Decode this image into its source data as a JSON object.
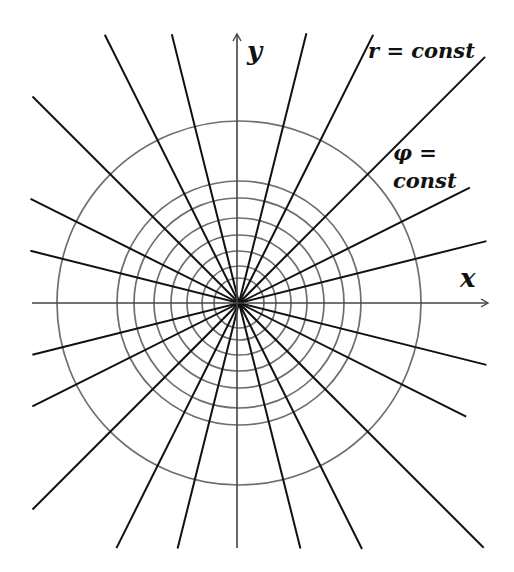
{
  "diagram": {
    "center": {
      "x": 239,
      "y": 303
    },
    "colors": {
      "rays": "#111111",
      "circles": "#6e6e6e",
      "axes": "#444444",
      "background": "#ffffff"
    },
    "axes": {
      "x_label": "x",
      "y_label": "y"
    },
    "annotations": {
      "r_const": "r = const",
      "phi_const_line1": "φ =",
      "phi_const_line2": "const"
    },
    "circle_radii": [
      25,
      37,
      52,
      68,
      85,
      105,
      122,
      182
    ],
    "ray_slopes_description": "Lines through origin with slopes 0, ±1/4, ±1/2, ±1, ±2, ±4, ∞",
    "rays": [
      {
        "angle_deg": 14.04,
        "length_pos": 255,
        "length_neg": 213
      },
      {
        "angle_deg": 26.57,
        "length_pos": 258,
        "length_neg": 231
      },
      {
        "angle_deg": 45.0,
        "length_pos": 348,
        "length_neg": 292
      },
      {
        "angle_deg": 63.43,
        "length_pos": 300,
        "length_neg": 274
      },
      {
        "angle_deg": 75.96,
        "length_pos": 278,
        "length_neg": 253
      },
      {
        "angle_deg": -14.04,
        "length_pos": 255,
        "length_neg": 215
      },
      {
        "angle_deg": -26.57,
        "length_pos": 254,
        "length_neg": 233
      },
      {
        "angle_deg": -45.0,
        "length_pos": 346,
        "length_neg": 292
      },
      {
        "angle_deg": -63.43,
        "length_pos": 275,
        "length_neg": 300
      },
      {
        "angle_deg": -75.96,
        "length_pos": 253,
        "length_neg": 277
      }
    ]
  }
}
